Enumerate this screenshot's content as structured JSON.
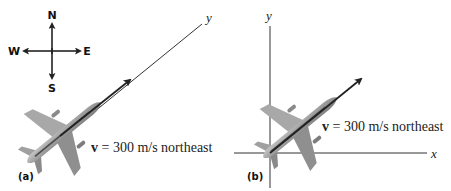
{
  "compass": {
    "north": "N",
    "south": "S",
    "east": "E",
    "west": "W"
  },
  "panel_a": {
    "label": "(a)",
    "axis_label": "y",
    "velocity_symbol": "v",
    "velocity_text": " = 300 m/s northeast"
  },
  "panel_b": {
    "label": "(b)",
    "y_axis_label": "y",
    "x_axis_label": "x",
    "velocity_symbol": "v",
    "velocity_text": " = 300 m/s northeast"
  },
  "colors": {
    "line": "#222222",
    "airplane_body": "#9a9a9a",
    "airplane_dark": "#5a5a5a",
    "airplane_light": "#c8c8c8"
  }
}
